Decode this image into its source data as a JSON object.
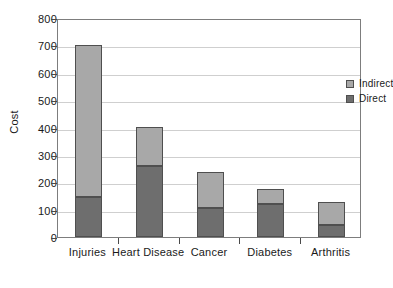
{
  "chart_data": {
    "type": "bar",
    "stacked": true,
    "title": "",
    "xlabel": "",
    "ylabel": "Cost",
    "categories": [
      "Injuries",
      "Heart Disease",
      "Cancer",
      "Diabetes",
      "Arthritis"
    ],
    "series": [
      {
        "name": "Direct",
        "color": "#6e6e6e",
        "values": [
          145,
          258,
          106,
          122,
          45
        ]
      },
      {
        "name": "Indirect",
        "color": "#a8a8a8",
        "values": [
          558,
          145,
          132,
          53,
          82
        ]
      }
    ],
    "totals": [
      703,
      403,
      238,
      175,
      127
    ],
    "ylim": [
      0,
      800
    ],
    "ytick_values": [
      0,
      100,
      200,
      300,
      400,
      500,
      600,
      700,
      800
    ],
    "ytick_labels": [
      "0",
      "100",
      "200",
      "300",
      "400",
      "500",
      "600",
      "700",
      "800"
    ],
    "grid": true,
    "legend_position": "top-right",
    "legend_entries": [
      "Indirect",
      "Direct"
    ]
  },
  "legend": {
    "indirect_label": "Indirect",
    "direct_label": "Direct"
  },
  "axis": {
    "y_title": "Cost"
  }
}
